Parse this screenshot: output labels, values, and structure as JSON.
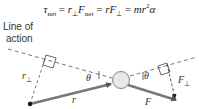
{
  "equation": "τ_net = r⊥F_net = rF⊥ = mr²α",
  "equation_parts": {
    "tau": "τ",
    "net1": "net",
    "eq1": " = ",
    "r": "r",
    "perp": "⊥",
    "F": "F",
    "net2": "net",
    "eq2": " = ",
    "r2": "r",
    "F2": "F",
    "perp2": "⊥",
    "eq3": " = ",
    "mr": "mr",
    "sq": "2",
    "alpha": "α"
  },
  "labels": {
    "line_of_action_1": "Line of",
    "line_of_action_2": "action",
    "r_perp": "r",
    "r_perp_sub": "⊥",
    "theta_left": "θ",
    "theta_right": "θ",
    "r": "r",
    "F": "F",
    "F_perp": "F",
    "F_perp_sub": "⊥"
  },
  "colors": {
    "arrow": "#777777",
    "dash": "#555555",
    "ball": "#e6e6e6"
  }
}
